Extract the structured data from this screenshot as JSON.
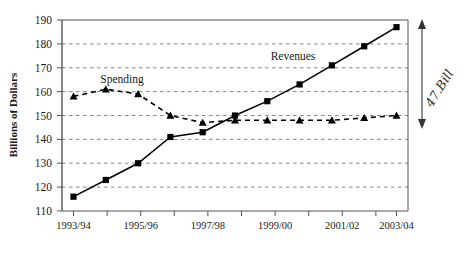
{
  "chart_data": {
    "type": "line",
    "title": "",
    "xlabel": "",
    "ylabel": "Billions of Dollars",
    "ylim": [
      110,
      190
    ],
    "yticks": [
      110,
      120,
      130,
      140,
      150,
      160,
      170,
      180,
      190
    ],
    "grid": true,
    "legend_position": "inline-annotations",
    "categories": [
      "1993/94",
      "1994/95",
      "1995/96",
      "1996/97",
      "1997/98",
      "1998/99",
      "1999/00",
      "2000/01",
      "2001/02",
      "2002/03",
      "2003/04"
    ],
    "xtick_labels": [
      "1993/94",
      "1995/96",
      "1997/98",
      "1999/00",
      "2001/02",
      "2003/04"
    ],
    "series": [
      {
        "name": "Revenues",
        "marker": "square",
        "linestyle": "solid",
        "color": "#000000",
        "values": [
          116,
          123,
          130,
          141,
          143,
          150,
          156,
          163,
          171,
          179,
          187
        ]
      },
      {
        "name": "Spending",
        "marker": "triangle",
        "linestyle": "dashed",
        "color": "#000000",
        "values": [
          158,
          161,
          159,
          150,
          147,
          148,
          148,
          148,
          148,
          149,
          150
        ]
      }
    ],
    "annotations": [
      {
        "name": "gap-annotation",
        "text": "47.Bill",
        "style": "handwritten-italic",
        "arrow": "double-headed-vertical",
        "from_value": 187,
        "to_value": 150,
        "at_category": "2003/04"
      },
      {
        "name": "revenues-inline-label",
        "text": "Revenues"
      },
      {
        "name": "spending-inline-label",
        "text": "Spending"
      }
    ]
  },
  "axis": {
    "ylabel": "Billions of Dollars",
    "yticks": [
      "190",
      "180",
      "170",
      "160",
      "150",
      "140",
      "130",
      "120",
      "110"
    ],
    "xticks": [
      "1993/94",
      "1995/96",
      "1997/98",
      "1999/00",
      "2001/02",
      "2003/04"
    ]
  },
  "labels": {
    "spending": "Spending",
    "revenues": "Revenues",
    "gap_note": "47.Bill"
  }
}
